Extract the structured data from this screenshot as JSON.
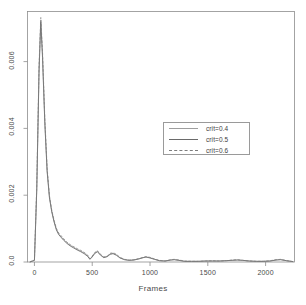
{
  "chart_data": {
    "type": "line",
    "title": "",
    "xlabel": "Frames",
    "ylabel": "",
    "xlim": [
      -60,
      2250
    ],
    "ylim": [
      0,
      0.0075
    ],
    "xticks": [
      0,
      500,
      1000,
      1500,
      2000
    ],
    "xticklabels": [
      "0",
      "500",
      "1000",
      "1500",
      "2000"
    ],
    "yticks": [
      0.0,
      0.002,
      0.004,
      0.006
    ],
    "yticklabels": [
      "0.0",
      "0.002",
      "0.004",
      "0.006"
    ],
    "grid": false,
    "legend_position": "center-right",
    "series": [
      {
        "name": "crit=0.4",
        "style": "solid",
        "color": "#9e9e9e",
        "x": [
          -40,
          0,
          20,
          40,
          55,
          70,
          90,
          110,
          130,
          150,
          170,
          190,
          210,
          230,
          250,
          280,
          310,
          340,
          370,
          400,
          430,
          460,
          480,
          500,
          520,
          545,
          570,
          600,
          630,
          655,
          680,
          710,
          740,
          780,
          820,
          860,
          900,
          940,
          965,
          1000,
          1040,
          1080,
          1130,
          1180,
          1210,
          1250,
          1300,
          1360,
          1420,
          1480,
          1540,
          1600,
          1660,
          1710,
          1755,
          1800,
          1860,
          1920,
          1980,
          2040,
          2090,
          2130,
          2180,
          2240
        ],
        "y": [
          0.0,
          5e-05,
          0.0022,
          0.0058,
          0.00725,
          0.0062,
          0.0042,
          0.00275,
          0.00195,
          0.00152,
          0.00122,
          0.00098,
          0.00084,
          0.00076,
          0.00068,
          0.00058,
          0.0005,
          0.00044,
          0.00038,
          0.00033,
          0.00027,
          0.00019,
          9e-05,
          0.00016,
          0.00026,
          0.00032,
          0.00022,
          0.00014,
          0.00017,
          0.00024,
          0.00026,
          0.00021,
          0.00013,
          7e-05,
          5e-05,
          6e-05,
          9e-05,
          0.00013,
          0.00015,
          0.00013,
          8e-05,
          4e-05,
          3e-05,
          6e-05,
          7e-05,
          5e-05,
          2e-05,
          2e-05,
          2e-05,
          3e-05,
          3e-05,
          3e-05,
          4e-05,
          5e-05,
          6e-05,
          5e-05,
          3e-05,
          2e-05,
          2e-05,
          3e-05,
          6e-05,
          7e-05,
          4e-05,
          1e-05
        ]
      },
      {
        "name": "crit=0.5",
        "style": "solid",
        "color": "#6a6a6a",
        "x": [
          -40,
          0,
          20,
          40,
          55,
          70,
          90,
          110,
          130,
          150,
          170,
          190,
          210,
          230,
          250,
          280,
          310,
          340,
          370,
          400,
          430,
          460,
          480,
          500,
          520,
          545,
          570,
          600,
          630,
          655,
          680,
          710,
          740,
          780,
          820,
          860,
          900,
          940,
          965,
          1000,
          1040,
          1080,
          1130,
          1180,
          1210,
          1250,
          1300,
          1360,
          1420,
          1480,
          1540,
          1600,
          1660,
          1710,
          1755,
          1800,
          1860,
          1920,
          1980,
          2040,
          2090,
          2130,
          2180,
          2240
        ],
        "y": [
          0.0,
          5e-05,
          0.00215,
          0.00572,
          0.00718,
          0.00612,
          0.00415,
          0.0027,
          0.00192,
          0.0015,
          0.0012,
          0.00096,
          0.00082,
          0.00074,
          0.00066,
          0.00056,
          0.00048,
          0.00042,
          0.00036,
          0.00031,
          0.00025,
          0.00017,
          8e-05,
          0.00015,
          0.00025,
          0.00031,
          0.00021,
          0.00013,
          0.00016,
          0.00023,
          0.00025,
          0.0002,
          0.00012,
          7e-05,
          5e-05,
          6e-05,
          9e-05,
          0.00013,
          0.00015,
          0.00012,
          8e-05,
          4e-05,
          3e-05,
          6e-05,
          7e-05,
          5e-05,
          2e-05,
          2e-05,
          2e-05,
          3e-05,
          3e-05,
          3e-05,
          4e-05,
          5e-05,
          6e-05,
          5e-05,
          3e-05,
          2e-05,
          2e-05,
          3e-05,
          6e-05,
          7e-05,
          4e-05,
          1e-05
        ]
      },
      {
        "name": "crit=0.6",
        "style": "dashed",
        "color": "#7d7d7d",
        "x": [
          -40,
          0,
          20,
          40,
          55,
          70,
          90,
          110,
          130,
          150,
          170,
          190,
          210,
          230,
          250,
          280,
          310,
          340,
          370,
          400,
          430,
          460,
          480,
          500,
          520,
          545,
          570,
          600,
          630,
          655,
          680,
          710,
          740,
          780,
          820,
          860,
          900,
          940,
          965,
          1000,
          1040,
          1080,
          1130,
          1180,
          1210,
          1250,
          1300,
          1360,
          1420,
          1480,
          1540,
          1600,
          1660,
          1710,
          1755,
          1800,
          1860,
          1920,
          1980,
          2040,
          2090,
          2130,
          2180,
          2240
        ],
        "y": [
          0.0,
          6e-05,
          0.00228,
          0.00588,
          0.00732,
          0.00628,
          0.00428,
          0.0028,
          0.00198,
          0.00155,
          0.00125,
          0.00101,
          0.00087,
          0.00079,
          0.00071,
          0.0006,
          0.00052,
          0.00046,
          0.0004,
          0.00035,
          0.00029,
          0.00021,
          0.0001,
          0.00018,
          0.00028,
          0.00034,
          0.00024,
          0.00015,
          0.00018,
          0.00026,
          0.00028,
          0.00023,
          0.00014,
          8e-05,
          6e-05,
          7e-05,
          0.0001,
          0.00014,
          0.00016,
          0.00014,
          9e-05,
          5e-05,
          3e-05,
          7e-05,
          8e-05,
          6e-05,
          3e-05,
          2e-05,
          2e-05,
          3e-05,
          4e-05,
          3e-05,
          4e-05,
          6e-05,
          7e-05,
          5e-05,
          3e-05,
          2e-05,
          2e-05,
          4e-05,
          7e-05,
          8e-05,
          4e-05,
          1e-05
        ]
      }
    ]
  },
  "axes": {
    "box_color": "#8d8d8d",
    "tick_color": "#8d8d8d"
  }
}
